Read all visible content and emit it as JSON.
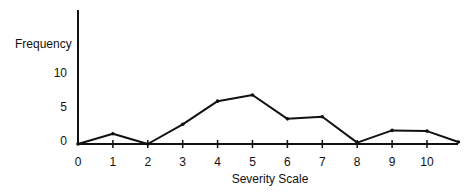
{
  "chart_data": {
    "type": "line",
    "title": "",
    "xlabel": "Severity Scale",
    "ylabel": "Frequency",
    "x_tick_labels": [
      "0",
      "1",
      "2",
      "3",
      "4",
      "5",
      "6",
      "7",
      "8",
      "9",
      "10"
    ],
    "y_tick_labels": [
      "0",
      "5",
      "10"
    ],
    "xlim": [
      0,
      10.9
    ],
    "ylim": [
      0,
      19
    ],
    "grid": false,
    "legend": null,
    "series": [
      {
        "name": "Frequency",
        "x": [
          0,
          1,
          2,
          3,
          4,
          5,
          6,
          7,
          8,
          9,
          10,
          10.9
        ],
        "y": [
          0,
          1.5,
          0,
          2.9,
          6.3,
          7.2,
          3.7,
          4.0,
          0.2,
          2.0,
          1.9,
          0.3
        ]
      }
    ]
  }
}
